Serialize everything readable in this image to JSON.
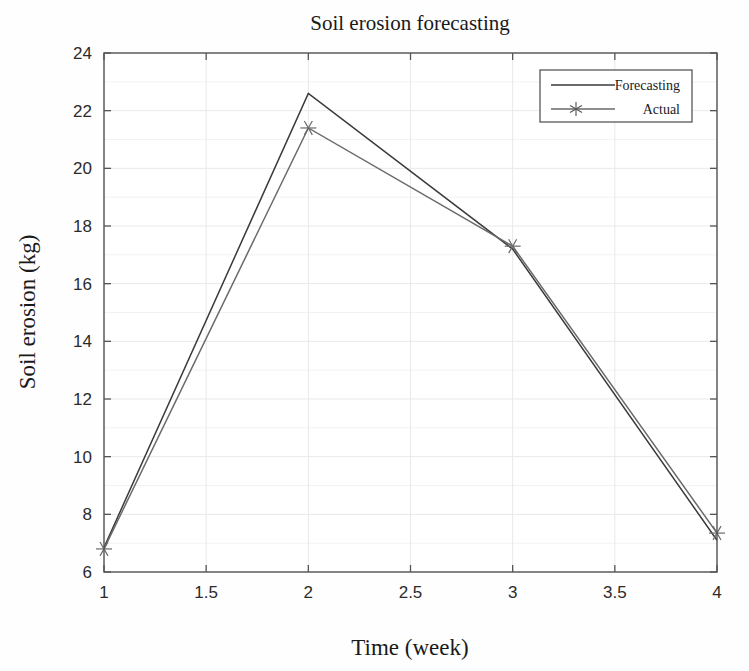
{
  "chart_data": {
    "type": "line",
    "title": "Soil erosion forecasting",
    "xlabel": "Time (week)",
    "ylabel": "Soil erosion (kg)",
    "x": [
      1,
      2,
      3,
      4
    ],
    "xlim": [
      1,
      4
    ],
    "ylim": [
      6,
      24
    ],
    "xticks": [
      1,
      1.5,
      2,
      2.5,
      3,
      3.5,
      4
    ],
    "xticklabels": [
      "1",
      "1.5",
      "2",
      "2.5",
      "3",
      "3.5",
      "4"
    ],
    "yticks": [
      6,
      8,
      10,
      12,
      14,
      16,
      18,
      20,
      22,
      24
    ],
    "yticklabels": [
      "6",
      "8",
      "10",
      "12",
      "14",
      "16",
      "18",
      "20",
      "22",
      "24"
    ],
    "grid": true,
    "legend_position": "upper-right",
    "series": [
      {
        "name": "Forecasting",
        "values": [
          6.85,
          22.6,
          17.2,
          7.1
        ],
        "color": "#3a3a3a",
        "marker": "none"
      },
      {
        "name": "Actual",
        "values": [
          6.8,
          21.4,
          17.3,
          7.35
        ],
        "color": "#6a6a6a",
        "marker": "asterisk"
      }
    ]
  },
  "legend": {
    "entries": [
      {
        "label": "Forecasting",
        "marker": "none"
      },
      {
        "label": "Actual",
        "marker": "asterisk"
      }
    ]
  },
  "colors": {
    "background": "#fefefe",
    "axis": "#555555",
    "grid_major": "#e9e9e9",
    "grid_minor": "#f2f2f2",
    "text": "#1a1a1a",
    "forecasting": "#3a3a3a",
    "actual": "#6a6a6a"
  }
}
